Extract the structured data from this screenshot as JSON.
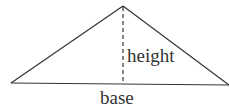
{
  "diagram": {
    "type": "triangle-area-diagram",
    "labels": {
      "height": "height",
      "base": "base"
    },
    "geometry": {
      "apex": [
        123,
        6
      ],
      "left_vertex": [
        11,
        83
      ],
      "right_vertex": [
        229,
        85
      ],
      "height_foot": [
        123,
        84
      ]
    },
    "colors": {
      "stroke": "#333333",
      "background": "#ffffff"
    }
  }
}
